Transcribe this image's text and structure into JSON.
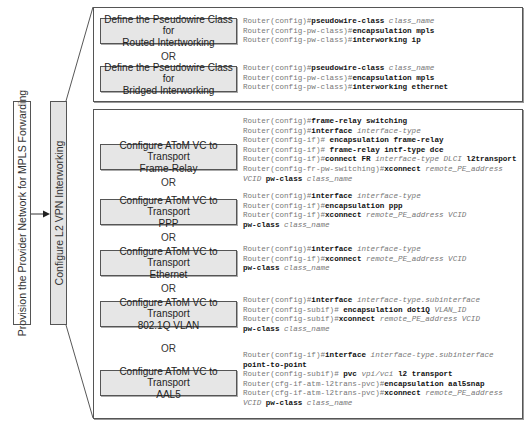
{
  "left": {
    "provision_label": "Provision the Provider Network for MPLS Forwarding",
    "l2vpn_label": "Configure L2 VPN Interworking",
    "arrow_icon": "arrow-right-icon"
  },
  "top_section": {
    "steps": [
      {
        "line1": "Define the Pseudowire Class for",
        "line2": "Routed Intertworking"
      },
      {
        "line1": "Define the Pseudowire Class for",
        "line2": "Bridged Interworking"
      }
    ],
    "or_label": "OR",
    "code_blocks": [
      [
        [
          {
            "t": "Router(config)#",
            "s": "n"
          },
          {
            "t": "pseudowire-class",
            "s": "b"
          },
          {
            "t": " ",
            "s": "n"
          },
          {
            "t": "class_name",
            "s": "i"
          }
        ],
        [
          {
            "t": "Router(config-pw-class)#",
            "s": "n"
          },
          {
            "t": "encapsulation mpls",
            "s": "b"
          }
        ],
        [
          {
            "t": "Router(config-pw-class)#",
            "s": "n"
          },
          {
            "t": "interworking ip",
            "s": "b"
          }
        ]
      ],
      [
        [
          {
            "t": "Router(config)#",
            "s": "n"
          },
          {
            "t": "pseudowire-class",
            "s": "b"
          },
          {
            "t": " ",
            "s": "n"
          },
          {
            "t": "class_name",
            "s": "i"
          }
        ],
        [
          {
            "t": "Router(config-pw-class)#",
            "s": "n"
          },
          {
            "t": "encapsulation mpls",
            "s": "b"
          }
        ],
        [
          {
            "t": "Router(config-pw-class)#",
            "s": "n"
          },
          {
            "t": "interworking ethernet",
            "s": "b"
          }
        ]
      ]
    ]
  },
  "bottom_section": {
    "steps": [
      {
        "line1": "Configure AToM VC to Transport",
        "line2": "Frame-Relay"
      },
      {
        "line1": "Configure AToM VC to Transport",
        "line2": "PPP"
      },
      {
        "line1": "Configure AToM VC to Transport",
        "line2": "Ethernet"
      },
      {
        "line1": "Configure AToM VC to Transport",
        "line2": "802.1Q VLAN"
      },
      {
        "line1": "Configure AToM VC to Transport",
        "line2": "AAL5"
      }
    ],
    "or_label": "OR",
    "code_blocks": [
      [
        [
          {
            "t": "Router(config)#",
            "s": "n"
          },
          {
            "t": "frame-relay switching",
            "s": "b"
          }
        ],
        [
          {
            "t": "Router(config)#",
            "s": "n"
          },
          {
            "t": "interface",
            "s": "b"
          },
          {
            "t": " ",
            "s": "n"
          },
          {
            "t": "interface-type",
            "s": "i"
          }
        ],
        [
          {
            "t": "Router(config-if)#",
            "s": "n"
          },
          {
            "t": " encapsulation frame-relay",
            "s": "b"
          }
        ],
        [
          {
            "t": "Router(config-if)#",
            "s": "n"
          },
          {
            "t": " frame-relay intf-type dce",
            "s": "b"
          }
        ],
        [
          {
            "t": "Router(config-if)#",
            "s": "n"
          },
          {
            "t": "connect FR",
            "s": "b"
          },
          {
            "t": " ",
            "s": "n"
          },
          {
            "t": "interface-type DLCI",
            "s": "i"
          },
          {
            "t": " l2transport",
            "s": "b"
          }
        ],
        [
          {
            "t": "Router(config-fr-pw-switching)#",
            "s": "n"
          },
          {
            "t": "xconnect",
            "s": "b"
          },
          {
            "t": " ",
            "s": "n"
          },
          {
            "t": "remote_PE_address",
            "s": "i"
          }
        ],
        [
          {
            "t": "VCID",
            "s": "i"
          },
          {
            "t": " pw-class",
            "s": "b"
          },
          {
            "t": " ",
            "s": "n"
          },
          {
            "t": "class_name",
            "s": "i"
          }
        ]
      ],
      [
        [
          {
            "t": "Router(config)#",
            "s": "n"
          },
          {
            "t": "interface",
            "s": "b"
          },
          {
            "t": " ",
            "s": "n"
          },
          {
            "t": "interface-type",
            "s": "i"
          }
        ],
        [
          {
            "t": "Router(config-if)#",
            "s": "n"
          },
          {
            "t": "encapsulation ppp",
            "s": "b"
          }
        ],
        [
          {
            "t": "Router(config-if)#",
            "s": "n"
          },
          {
            "t": "xconnect",
            "s": "b"
          },
          {
            "t": " ",
            "s": "n"
          },
          {
            "t": "remote_PE_address VCID",
            "s": "i"
          }
        ],
        [
          {
            "t": "pw-class",
            "s": "b"
          },
          {
            "t": " ",
            "s": "n"
          },
          {
            "t": "class_name",
            "s": "i"
          }
        ]
      ],
      [
        [
          {
            "t": "Router(config)#",
            "s": "n"
          },
          {
            "t": "interface",
            "s": "b"
          },
          {
            "t": " ",
            "s": "n"
          },
          {
            "t": "interface-type",
            "s": "i"
          }
        ],
        [
          {
            "t": "Router(config-if)#",
            "s": "n"
          },
          {
            "t": "xconnect",
            "s": "b"
          },
          {
            "t": " ",
            "s": "n"
          },
          {
            "t": "remote_PE_address VCID",
            "s": "i"
          }
        ],
        [
          {
            "t": "pw-class",
            "s": "b"
          },
          {
            "t": " ",
            "s": "n"
          },
          {
            "t": "class_name",
            "s": "i"
          }
        ]
      ],
      [
        [
          {
            "t": "Router(config)#",
            "s": "n"
          },
          {
            "t": "interface",
            "s": "b"
          },
          {
            "t": " ",
            "s": "n"
          },
          {
            "t": "interface-type.subinterface",
            "s": "i"
          }
        ],
        [
          {
            "t": "Router(config-subif)#",
            "s": "n"
          },
          {
            "t": " encapsulation dot1Q",
            "s": "b"
          },
          {
            "t": " ",
            "s": "n"
          },
          {
            "t": "VLAN_ID",
            "s": "i"
          }
        ],
        [
          {
            "t": "Router(config-subif)#",
            "s": "n"
          },
          {
            "t": "xconnect",
            "s": "b"
          },
          {
            "t": " ",
            "s": "n"
          },
          {
            "t": "remote_PE_address VCID",
            "s": "i"
          }
        ],
        [
          {
            "t": "pw-class",
            "s": "b"
          },
          {
            "t": " ",
            "s": "n"
          },
          {
            "t": "class_name",
            "s": "i"
          }
        ]
      ],
      [
        [
          {
            "t": "Router(config-if)#",
            "s": "n"
          },
          {
            "t": "interface",
            "s": "b"
          },
          {
            "t": " ",
            "s": "n"
          },
          {
            "t": "interface-type.subinterface",
            "s": "i"
          }
        ],
        [
          {
            "t": "point-to-point",
            "s": "b"
          }
        ],
        [
          {
            "t": "Router(config-subif)#",
            "s": "n"
          },
          {
            "t": " pvc",
            "s": "b"
          },
          {
            "t": " ",
            "s": "n"
          },
          {
            "t": "vpi/vci",
            "s": "i"
          },
          {
            "t": " l2 transport",
            "s": "b"
          }
        ],
        [
          {
            "t": "Router(cfg-if-atm-l2trans-pvc)#",
            "s": "n"
          },
          {
            "t": "encapsulation aal5snap",
            "s": "b"
          }
        ],
        [
          {
            "t": "Router(cfg-if-atm-l2trans-pvc)#",
            "s": "n"
          },
          {
            "t": "xconnect",
            "s": "b"
          },
          {
            "t": " ",
            "s": "n"
          },
          {
            "t": "remote_PE_address",
            "s": "i"
          }
        ],
        [
          {
            "t": "VCID",
            "s": "i"
          },
          {
            "t": " pw-class",
            "s": "b"
          },
          {
            "t": " ",
            "s": "n"
          },
          {
            "t": "class_name",
            "s": "i"
          }
        ]
      ]
    ]
  }
}
